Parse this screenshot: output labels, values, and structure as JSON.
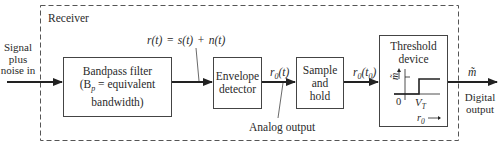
{
  "receiver": {
    "label": "Receiver"
  },
  "input": {
    "label_lines": [
      "Signal",
      "plus",
      "noise in"
    ]
  },
  "blocks": {
    "bandpass": {
      "line1": "Bandpass filter",
      "line2": "(B",
      "line2_sub": "p",
      "line2_rest": " = equivalent bandwidth)"
    },
    "envelope": {
      "line1": "Envelope",
      "line2": "detector"
    },
    "sample_hold": {
      "line1": "Sample",
      "line2": "and",
      "line3": "hold"
    },
    "threshold": {
      "line1": "Threshold",
      "line2": "device",
      "y_axis_label": "m̃",
      "x_origin": "0",
      "threshold_label": "V",
      "threshold_sub": "T",
      "x_axis_label": "r",
      "x_axis_sub": "0"
    }
  },
  "signals": {
    "rt_equation": "r(t) = s(t) + n(t)",
    "r0t": {
      "base": "r",
      "sub": "0",
      "arg": "(t)"
    },
    "r0t0": {
      "base": "r",
      "sub": "0",
      "arg_open": "(t",
      "arg_sub": "0",
      "arg_close": ")"
    },
    "analog_output": "Analog output",
    "m_tilde": "m̃",
    "digital_output_lines": [
      "Digital",
      "output"
    ]
  }
}
